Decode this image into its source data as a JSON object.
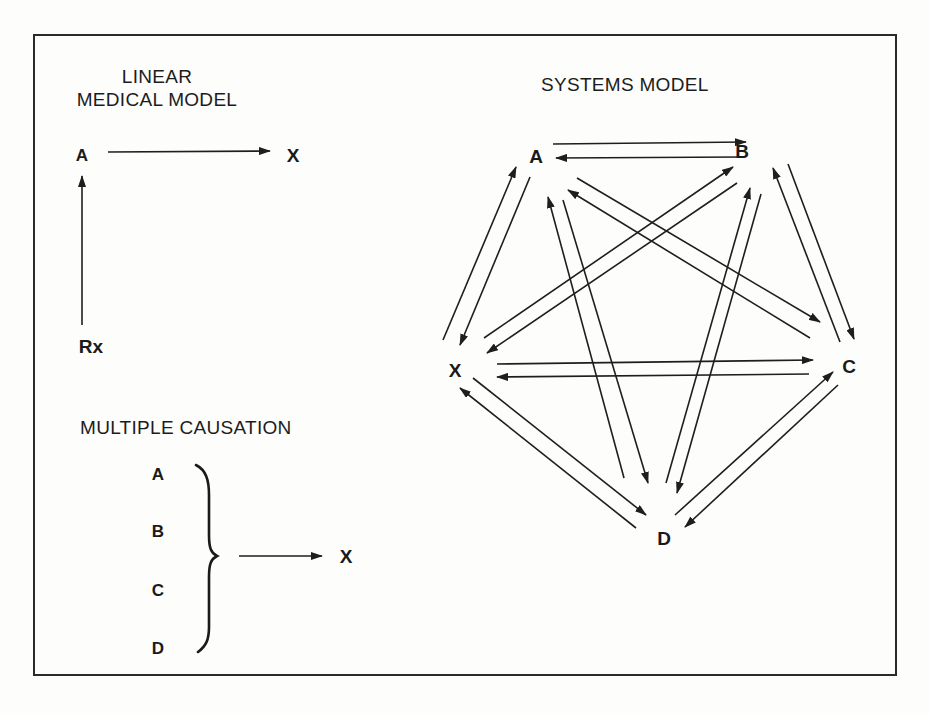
{
  "linear_model": {
    "title_line1": "LINEAR",
    "title_line2": "MEDICAL MODEL",
    "nodes": {
      "a": "A",
      "x": "X",
      "rx": "Rx"
    },
    "edges": [
      {
        "from": "A",
        "to": "X"
      },
      {
        "from": "Rx",
        "to": "A"
      }
    ]
  },
  "multiple_causation": {
    "title": "MULTIPLE CAUSATION",
    "causes": [
      "A",
      "B",
      "C",
      "D"
    ],
    "effect": "X"
  },
  "systems_model": {
    "title": "SYSTEMS MODEL",
    "nodes": {
      "a": "A",
      "b": "B",
      "c": "C",
      "d": "D",
      "x": "X"
    },
    "edges_note": "bidirectional arrows between every pair of nodes",
    "edges": [
      {
        "from": "A",
        "to": "B"
      },
      {
        "from": "B",
        "to": "A"
      },
      {
        "from": "A",
        "to": "C"
      },
      {
        "from": "C",
        "to": "A"
      },
      {
        "from": "A",
        "to": "D"
      },
      {
        "from": "D",
        "to": "A"
      },
      {
        "from": "A",
        "to": "X"
      },
      {
        "from": "X",
        "to": "A"
      },
      {
        "from": "B",
        "to": "C"
      },
      {
        "from": "C",
        "to": "B"
      },
      {
        "from": "B",
        "to": "D"
      },
      {
        "from": "D",
        "to": "B"
      },
      {
        "from": "B",
        "to": "X"
      },
      {
        "from": "X",
        "to": "B"
      },
      {
        "from": "C",
        "to": "D"
      },
      {
        "from": "D",
        "to": "C"
      },
      {
        "from": "C",
        "to": "X"
      },
      {
        "from": "X",
        "to": "C"
      },
      {
        "from": "D",
        "to": "X"
      },
      {
        "from": "X",
        "to": "D"
      }
    ]
  }
}
